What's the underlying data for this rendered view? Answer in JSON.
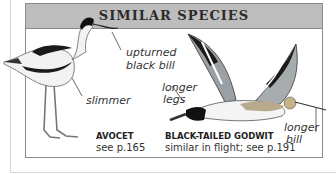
{
  "header": {
    "title": "SIMILAR SPECIES"
  },
  "species": [
    {
      "name": "AVOCET",
      "desc": "see p.165",
      "annotations": [
        "upturned",
        "black bill",
        "slimmer"
      ]
    },
    {
      "name": "BLACK-TAILED GODWIT",
      "desc": "similar in flight; see p.191",
      "annotations": [
        "longer",
        "legs",
        "longer",
        "bill"
      ]
    }
  ],
  "colors": {
    "header_bg": "#bdbdbd",
    "border": "#8a8a8a",
    "text": "#2b2b2b"
  }
}
